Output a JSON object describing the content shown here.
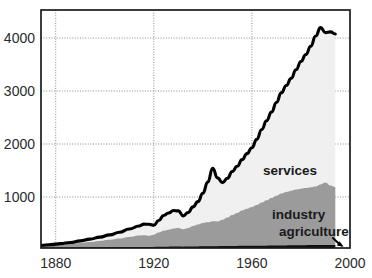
{
  "chart_data": {
    "type": "area",
    "title": "",
    "subtitle": "",
    "xlabel": "",
    "ylabel": "",
    "xlim": [
      1874,
      2000
    ],
    "ylim": [
      0,
      4500
    ],
    "grid": true,
    "legend_position": "inline-annotations",
    "stacked": true,
    "xticks": [
      1880,
      1920,
      1960,
      2000
    ],
    "xtick_labels": [
      "1880",
      "1920",
      "1960",
      "2000"
    ],
    "yticks": [
      1000,
      2000,
      3000,
      4000
    ],
    "ytick_labels": [
      "1000",
      "2000",
      "3000",
      "4000"
    ],
    "annotations": [
      {
        "text": "services",
        "x": 1952,
        "y": 1720
      },
      {
        "text": "industry",
        "x": 1956,
        "y": 870
      },
      {
        "text": "agriculture",
        "x": 1962,
        "y": 540
      }
    ],
    "colors": {
      "agriculture": "#111111",
      "industry": "#9b9b9b",
      "services": "#f0f0f0",
      "total_line": "#000000",
      "grid": "#8c8c8c",
      "frame": "#1b1b1b",
      "background": "#ffffff"
    },
    "x": [
      1874,
      1878,
      1882,
      1886,
      1890,
      1894,
      1898,
      1902,
      1906,
      1910,
      1914,
      1916,
      1918,
      1920,
      1922,
      1924,
      1926,
      1928,
      1930,
      1932,
      1934,
      1936,
      1938,
      1940,
      1942,
      1944,
      1946,
      1948,
      1950,
      1952,
      1954,
      1956,
      1958,
      1960,
      1962,
      1964,
      1966,
      1968,
      1970,
      1972,
      1974,
      1976,
      1978,
      1980,
      1982,
      1984,
      1986,
      1988,
      1990,
      1992,
      1994
    ],
    "series": [
      {
        "name": "agriculture",
        "values": [
          38,
          40,
          42,
          44,
          46,
          48,
          50,
          52,
          54,
          56,
          58,
          58,
          56,
          58,
          60,
          62,
          62,
          64,
          64,
          62,
          64,
          66,
          68,
          70,
          70,
          72,
          72,
          74,
          74,
          76,
          76,
          78,
          78,
          80,
          80,
          82,
          82,
          84,
          84,
          86,
          86,
          88,
          88,
          90,
          90,
          92,
          92,
          94,
          94,
          96,
          96
        ]
      },
      {
        "name": "industry",
        "values": [
          40,
          48,
          58,
          70,
          86,
          104,
          122,
          142,
          164,
          190,
          214,
          222,
          214,
          232,
          268,
          300,
          318,
          340,
          352,
          330,
          352,
          388,
          414,
          440,
          452,
          470,
          468,
          498,
          540,
          586,
          624,
          668,
          700,
          730,
          768,
          812,
          856,
          898,
          940,
          980,
          1008,
          1030,
          1052,
          1066,
          1078,
          1092,
          1106,
          1142,
          1178,
          1120,
          1090
        ]
      },
      {
        "name": "services",
        "values": [
          10,
          14,
          20,
          28,
          40,
          54,
          70,
          92,
          118,
          150,
          182,
          208,
          216,
          176,
          228,
          288,
          318,
          340,
          322,
          252,
          292,
          360,
          430,
          560,
          760,
          1000,
          820,
          700,
          740,
          820,
          880,
          960,
          1040,
          1120,
          1240,
          1380,
          1500,
          1620,
          1760,
          1900,
          2010,
          2120,
          2260,
          2400,
          2520,
          2660,
          2840,
          2960,
          2830,
          2900,
          2890
        ]
      }
    ],
    "total_line": {
      "name": "total (top of services)",
      "values": [
        88,
        102,
        120,
        142,
        172,
        206,
        242,
        286,
        336,
        396,
        454,
        488,
        486,
        466,
        556,
        650,
        698,
        744,
        738,
        644,
        708,
        814,
        912,
        1070,
        1282,
        1542,
        1360,
        1272,
        1354,
        1482,
        1580,
        1706,
        1818,
        1930,
        2088,
        2274,
        2438,
        2602,
        2784,
        2966,
        3104,
        3238,
        3400,
        3556,
        3688,
        3844,
        4038,
        4196,
        4102,
        4116,
        4076
      ]
    }
  }
}
